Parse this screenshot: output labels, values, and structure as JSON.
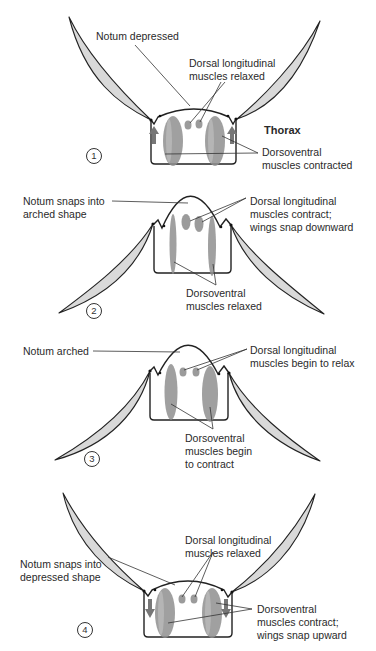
{
  "figure": {
    "thorax_label": "Thorax",
    "colors": {
      "wing_fill": "#d9d9d9",
      "outline": "#222222",
      "muscle": "#8f8f8f",
      "background": "#ffffff"
    }
  },
  "panels": [
    {
      "step": "1",
      "labels": {
        "notum": "Notum depressed",
        "dorsal_l1": "Dorsal longitudinal",
        "dorsal_l2": "muscles relaxed",
        "dorsoventral_l1": "Dorsoventral",
        "dorsoventral_l2": "muscles contracted"
      },
      "wings": "up",
      "arrows": "up"
    },
    {
      "step": "2",
      "labels": {
        "notum_l1": "Notum snaps into",
        "notum_l2": "arched shape",
        "dorsal_l1": "Dorsal longitudinal",
        "dorsal_l2": "muscles contract;",
        "dorsal_l3": "wings snap downward",
        "dorsoventral_l1": "Dorsoventral",
        "dorsoventral_l2": "muscles relaxed"
      },
      "wings": "down"
    },
    {
      "step": "3",
      "labels": {
        "notum": "Notum arched",
        "dorsal_l1": "Dorsal longitudinal",
        "dorsal_l2": "muscles begin to relax",
        "dorsoventral_l1": "Dorsoventral",
        "dorsoventral_l2": "muscles begin",
        "dorsoventral_l3": "to contract"
      },
      "wings": "down"
    },
    {
      "step": "4",
      "labels": {
        "notum_l1": "Notum snaps into",
        "notum_l2": "depressed shape",
        "dorsal_l1": "Dorsal longitudinal",
        "dorsal_l2": "muscles relaxed",
        "dorsoventral_l1": "Dorsoventral",
        "dorsoventral_l2": "muscles contract;",
        "dorsoventral_l3": "wings snap upward"
      },
      "wings": "up",
      "arrows": "down"
    }
  ]
}
